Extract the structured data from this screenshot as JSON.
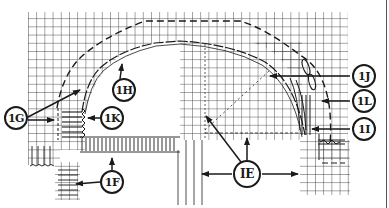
{
  "diagram": {
    "type": "technical-line-drawing",
    "colors": {
      "ink": "#1a1a1a",
      "grid": "#3a3a3a",
      "background": "#ffffff"
    },
    "callouts": [
      {
        "id": "1E",
        "label": "IE"
      },
      {
        "id": "1F",
        "label": "1F"
      },
      {
        "id": "1G",
        "label": "1G"
      },
      {
        "id": "1H",
        "label": "1H"
      },
      {
        "id": "1I",
        "label": "1I"
      },
      {
        "id": "1J",
        "label": "1J"
      },
      {
        "id": "1K",
        "label": "1K"
      },
      {
        "id": "1L",
        "label": "1L"
      }
    ]
  }
}
